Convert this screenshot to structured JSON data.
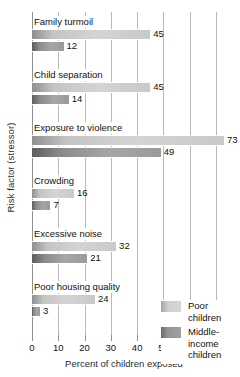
{
  "chart_data": {
    "type": "bar",
    "orientation": "horizontal",
    "title": "",
    "xlabel": "Percent of children exposed",
    "ylabel": "Risk factor (stressor)",
    "xlim": [
      0,
      70
    ],
    "xticks": [
      0,
      10,
      20,
      30,
      40,
      50,
      60,
      70
    ],
    "grid": true,
    "legend_position": "inside-bottom-right",
    "categories": [
      "Family turmoil",
      "Child separation",
      "Exposure to violence",
      "Crowding",
      "Excessive noise",
      "Poor housing quality"
    ],
    "series": [
      {
        "name": "Poor children",
        "color": "#d4d4d4",
        "values": [
          45,
          45,
          73,
          16,
          32,
          24
        ]
      },
      {
        "name": "Middle-income children",
        "color": "#8a8a8a",
        "values": [
          12,
          14,
          49,
          7,
          21,
          3
        ]
      }
    ]
  },
  "axis": {
    "y_title": "Risk factor (stressor)",
    "x_title": "Percent of children exposed",
    "x_tick_labels": [
      "0",
      "10",
      "20",
      "30",
      "40",
      "50",
      "60",
      "70"
    ]
  },
  "legend": {
    "items": [
      {
        "label": "Poor children",
        "swatch": "poor"
      },
      {
        "label": "Middle-income children",
        "swatch": "middle"
      }
    ]
  },
  "groups": [
    {
      "label": "Family turmoil",
      "poor_value": "45",
      "middle_value": "12"
    },
    {
      "label": "Child separation",
      "poor_value": "45",
      "middle_value": "14"
    },
    {
      "label": "Exposure to violence",
      "poor_value": "73",
      "middle_value": "49"
    },
    {
      "label": "Crowding",
      "poor_value": "16",
      "middle_value": "7"
    },
    {
      "label": "Excessive noise",
      "poor_value": "32",
      "middle_value": "21"
    },
    {
      "label": "Poor housing quality",
      "poor_value": "24",
      "middle_value": "3"
    }
  ]
}
